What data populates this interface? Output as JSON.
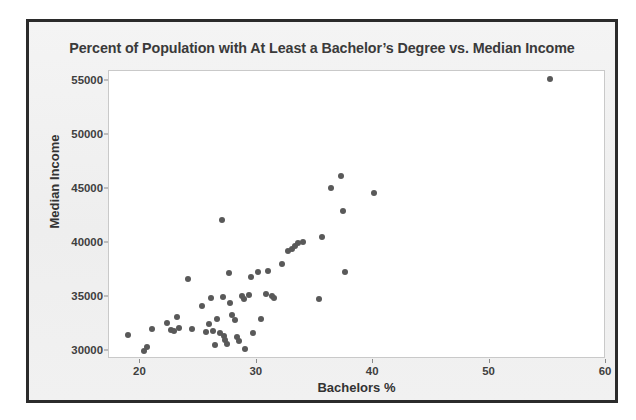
{
  "chart_data": {
    "type": "scatter",
    "title": "Percent of Population with At Least a Bachelor’s Degree vs. Median Income",
    "xlabel": "Bachelors %",
    "ylabel": "Median Income",
    "xlim": [
      17.3,
      60.0
    ],
    "ylim": [
      29300,
      55900
    ],
    "xticks": [
      20,
      30,
      40,
      50,
      60
    ],
    "xtick_labels": [
      "20",
      "30",
      "40",
      "50",
      "60"
    ],
    "yticks": [
      30000,
      35000,
      40000,
      45000,
      50000,
      55000
    ],
    "ytick_labels": [
      "30000",
      "35000",
      "40000",
      "45000",
      "50000",
      "55000"
    ],
    "grid": false,
    "legend": false,
    "marker_color": "#595959",
    "plot_background": "#ffffff",
    "figure_background": "#f1f1f1",
    "series": [
      {
        "name": "States",
        "points": [
          [
            18.9,
            31500
          ],
          [
            20.3,
            30000
          ],
          [
            20.6,
            30450
          ],
          [
            21.0,
            32100
          ],
          [
            22.3,
            32600
          ],
          [
            22.6,
            32000
          ],
          [
            22.9,
            31900
          ],
          [
            23.1,
            33200
          ],
          [
            23.3,
            32200
          ],
          [
            24.1,
            36700
          ],
          [
            24.4,
            32100
          ],
          [
            25.3,
            34200
          ],
          [
            25.6,
            31800
          ],
          [
            25.9,
            32500
          ],
          [
            26.1,
            34900
          ],
          [
            26.2,
            31900
          ],
          [
            26.4,
            30600
          ],
          [
            26.6,
            33000
          ],
          [
            26.8,
            31700
          ],
          [
            27.0,
            42100
          ],
          [
            27.1,
            35000
          ],
          [
            27.2,
            31400
          ],
          [
            27.3,
            31100
          ],
          [
            27.4,
            30700
          ],
          [
            27.6,
            37200
          ],
          [
            27.7,
            34500
          ],
          [
            27.9,
            33400
          ],
          [
            28.1,
            32900
          ],
          [
            28.3,
            31300
          ],
          [
            28.5,
            31000
          ],
          [
            28.7,
            35100
          ],
          [
            28.9,
            34800
          ],
          [
            29.0,
            30250
          ],
          [
            29.3,
            35200
          ],
          [
            29.5,
            36900
          ],
          [
            29.7,
            31700
          ],
          [
            30.1,
            37300
          ],
          [
            30.4,
            33000
          ],
          [
            30.8,
            35300
          ],
          [
            31.0,
            37400
          ],
          [
            31.3,
            35100
          ],
          [
            31.5,
            34900
          ],
          [
            32.2,
            38100
          ],
          [
            32.7,
            39300
          ],
          [
            33.0,
            39500
          ],
          [
            33.3,
            39700
          ],
          [
            33.5,
            40000
          ],
          [
            34.0,
            40100
          ],
          [
            35.3,
            34800
          ],
          [
            35.6,
            40600
          ],
          [
            36.4,
            45100
          ],
          [
            37.2,
            46200
          ],
          [
            37.4,
            43000
          ],
          [
            37.6,
            37300
          ],
          [
            40.1,
            44600
          ],
          [
            55.2,
            55200
          ]
        ]
      }
    ]
  }
}
